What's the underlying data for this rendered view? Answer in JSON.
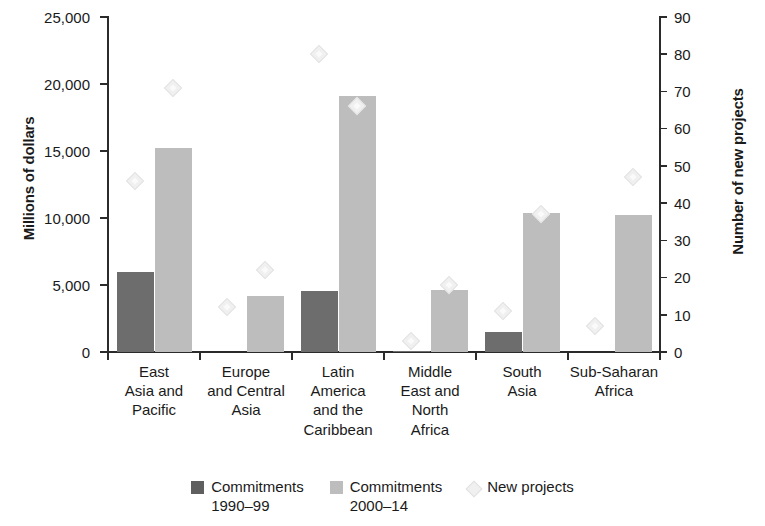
{
  "chart_data": {
    "type": "bar",
    "title": "",
    "subtitle": "",
    "categories": [
      "East\nAsia and\nPacific",
      "Europe\nand Central\nAsia",
      "Latin\nAmerica\nand the\nCaribbean",
      "Middle\nEast and\nNorth\nAfrica",
      "South\nAsia",
      "Sub-Saharan\nAfrica"
    ],
    "xlabel": "",
    "ylabel": "Millions of dollars",
    "ylabel_secondary": "Number of new projects",
    "ylim": [
      0,
      25000
    ],
    "ylim_secondary": [
      0,
      90
    ],
    "yticks": [
      0,
      5000,
      10000,
      15000,
      20000,
      25000
    ],
    "ytick_labels": [
      "0",
      "5,000",
      "10,000",
      "15,000",
      "20,000",
      "25,000"
    ],
    "yticks_secondary": [
      0,
      10,
      20,
      30,
      40,
      50,
      60,
      70,
      80,
      90
    ],
    "ytick_labels_secondary": [
      "0",
      "10",
      "20",
      "30",
      "40",
      "50",
      "60",
      "70",
      "80",
      "90"
    ],
    "grid": false,
    "legend_position": "bottom",
    "series": [
      {
        "name": "Commitments 1990–99",
        "axis": "left",
        "type": "bar",
        "color": "#6d6d6d",
        "values": [
          6000,
          0,
          4550,
          100,
          1500,
          0
        ]
      },
      {
        "name": "Commitments 2000–14",
        "axis": "left",
        "type": "bar",
        "color": "#bdbdbd",
        "values": [
          15250,
          4200,
          19100,
          4600,
          10350,
          10250
        ]
      },
      {
        "name": "New projects",
        "axis": "right",
        "type": "scatter",
        "color": "#f0f0f0",
        "values_1990_99": [
          46,
          12,
          80,
          3,
          11,
          7
        ],
        "values_2000_14": [
          71,
          22,
          66,
          18,
          37,
          47
        ]
      }
    ]
  },
  "axes": {
    "left": {
      "title": "Millions of dollars",
      "ticks": [
        "25,000",
        "20,000",
        "15,000",
        "10,000",
        "5,000",
        "0"
      ]
    },
    "right": {
      "title": "Number of new projects",
      "ticks": [
        "90",
        "80",
        "70",
        "60",
        "50",
        "40",
        "30",
        "20",
        "10",
        "0"
      ]
    }
  },
  "legend": {
    "items": [
      {
        "label": "Commitments\n1990–99",
        "swatch": "dark-square-swatch"
      },
      {
        "label": "Commitments\n2000–14",
        "swatch": "light-square-swatch"
      },
      {
        "label": "New projects",
        "swatch": "diamond-marker-swatch"
      }
    ]
  }
}
